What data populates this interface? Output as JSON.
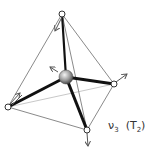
{
  "diagram": {
    "type": "tetrahedral molecular vibration mode",
    "label": {
      "mode": "ν",
      "mode_index": "3",
      "symmetry_open": "(T",
      "symmetry_index": "2",
      "symmetry_close": ")"
    },
    "atoms": {
      "center": {
        "x": 66,
        "y": 77,
        "r": 7
      },
      "vertices": [
        {
          "name": "top",
          "x": 62,
          "y": 14
        },
        {
          "name": "right",
          "x": 114,
          "y": 84
        },
        {
          "name": "left",
          "x": 8,
          "y": 107
        },
        {
          "name": "bottom",
          "x": 87,
          "y": 130
        }
      ]
    },
    "displacement_arrows": [
      {
        "atom": "top",
        "to_x": 55,
        "to_y": 31
      },
      {
        "atom": "right",
        "to_x": 127,
        "to_y": 74
      },
      {
        "atom": "left",
        "to_x": 20,
        "to_y": 93
      },
      {
        "atom": "bottom",
        "to_x": 88,
        "to_y": 146
      },
      {
        "atom": "center",
        "to_x": 50,
        "to_y": 67
      }
    ],
    "colors": {
      "bond": "#111111",
      "edge": "#8a8a8a",
      "hidden_edge": "#c8c8c8",
      "arrow": "#555555",
      "atom_fill": "#ffffff"
    }
  }
}
